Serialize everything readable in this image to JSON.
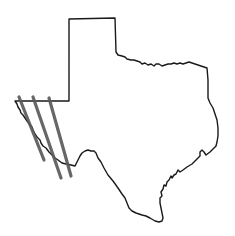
{
  "map": {
    "subject": "Texas state outline",
    "outline_color": "#1a1a1a",
    "overlay_color": "#5a5a5a",
    "overlay_lines": [
      {
        "name": "line-1",
        "x1": 19,
        "y1": 97,
        "x2": 44,
        "y2": 160
      },
      {
        "name": "line-2",
        "x1": 33,
        "y1": 97,
        "x2": 61,
        "y2": 178
      },
      {
        "name": "line-3",
        "x1": 49,
        "y1": 98,
        "x2": 71,
        "y2": 176
      }
    ]
  }
}
